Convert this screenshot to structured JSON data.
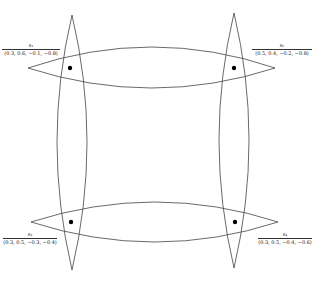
{
  "diagram": {
    "nodes": [
      {
        "id": "s1",
        "name": "s₁",
        "vector": "(0.3, 0.6, −0.1, −0.8)",
        "position": "top-left"
      },
      {
        "id": "s2",
        "name": "s₂",
        "vector": "(0.5, 0.4, −0.2, −0.8)",
        "position": "top-right"
      },
      {
        "id": "s3",
        "name": "s₃",
        "vector": "(0.3, 0.5, −0.3, −0.4)",
        "position": "bottom-left"
      },
      {
        "id": "s4",
        "name": "s₄",
        "vector": "(0.3, 0.5, −0.4, −0.6)",
        "position": "bottom-right"
      }
    ],
    "shapes": {
      "horizontal_lenses": 2,
      "vertical_lenses": 2,
      "stroke_color": "#333333",
      "dot_color": "#000000"
    }
  }
}
